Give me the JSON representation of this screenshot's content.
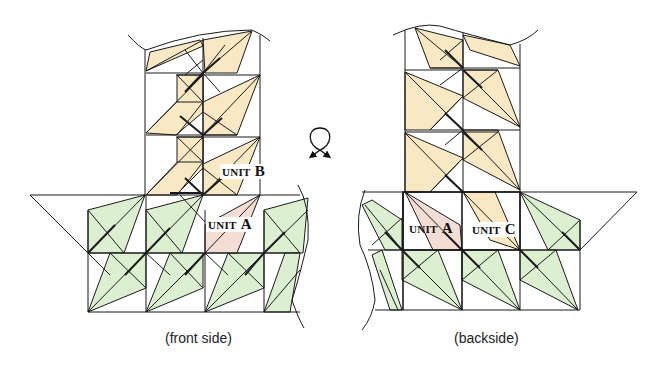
{
  "colors": {
    "cream": "#f8e8c4",
    "green": "#dcefd0",
    "pink": "#f3ddd4",
    "stroke": "#1a1a1a"
  },
  "front": {
    "caption": "(front side)",
    "unit_b": {
      "prefix": "UNIT",
      "letter": "B"
    },
    "unit_a": {
      "prefix": "UNIT",
      "letter": "A"
    }
  },
  "back": {
    "caption": "(backside)",
    "unit_a": {
      "prefix": "UNIT",
      "letter": "A"
    },
    "unit_c": {
      "prefix": "UNIT",
      "letter": "C"
    }
  },
  "flip_symbol": {
    "icon": "turn-over-icon"
  }
}
